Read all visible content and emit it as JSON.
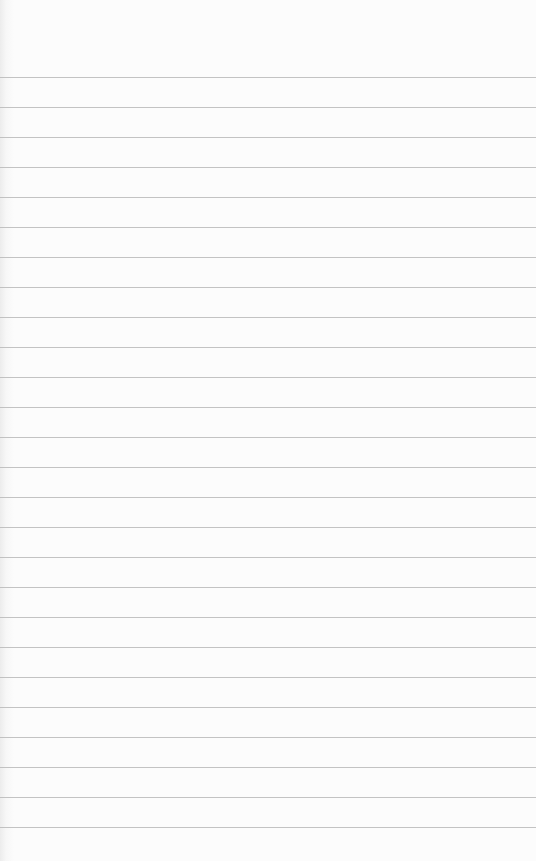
{
  "paper": {
    "type": "lined-paper",
    "line_color": "#b9b9b9",
    "background_color": "#fbfbfb",
    "first_line_y": 77,
    "line_spacing": 30,
    "line_count": 26
  }
}
